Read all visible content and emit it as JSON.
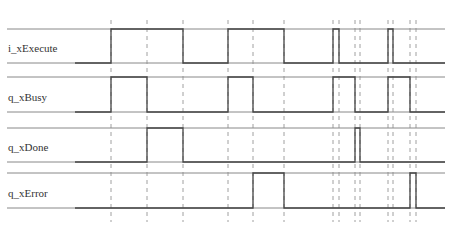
{
  "diagram": {
    "type": "timing-diagram",
    "x_start": 7,
    "x_end": 445,
    "colors": {
      "rail": "#888888",
      "waveform": "#444444",
      "marker": "#a0a0a0",
      "label": "#333333"
    },
    "time_markers": [
      111,
      147,
      183,
      228,
      253,
      284,
      333,
      339,
      355,
      360,
      388,
      393,
      410,
      416
    ],
    "signals": [
      {
        "name": "i_xExecute",
        "label_y": 48,
        "high_y": 29,
        "low_y": 63,
        "high_intervals": [
          [
            111,
            183
          ],
          [
            228,
            284
          ],
          [
            333,
            339
          ],
          [
            388,
            393
          ]
        ]
      },
      {
        "name": "q_xBusy",
        "label_y": 97,
        "high_y": 77,
        "low_y": 112,
        "high_intervals": [
          [
            111,
            147
          ],
          [
            228,
            253
          ],
          [
            333,
            355
          ],
          [
            388,
            410
          ]
        ]
      },
      {
        "name": "q_xDone",
        "label_y": 147,
        "high_y": 128,
        "low_y": 162,
        "high_intervals": [
          [
            147,
            183
          ],
          [
            355,
            360
          ]
        ]
      },
      {
        "name": "q_xError",
        "label_y": 193,
        "high_y": 173,
        "low_y": 208,
        "high_intervals": [
          [
            253,
            284
          ],
          [
            410,
            416
          ]
        ]
      }
    ]
  }
}
